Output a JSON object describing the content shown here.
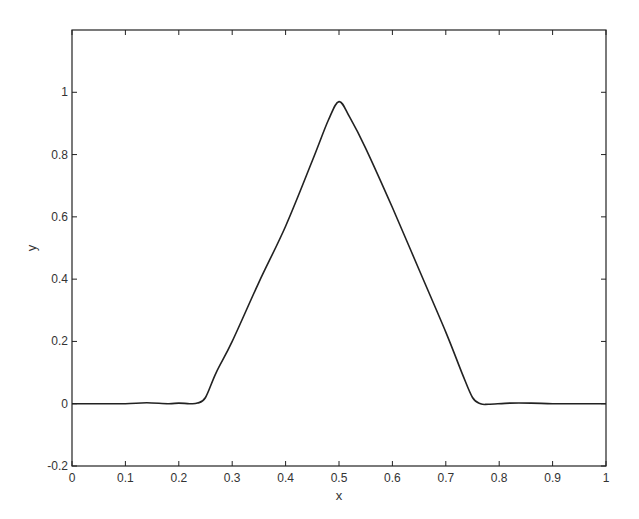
{
  "chart_data": {
    "type": "line",
    "title": "",
    "xlabel": "x",
    "ylabel": "y",
    "xlim": [
      0,
      1
    ],
    "ylim": [
      -0.2,
      1.2
    ],
    "grid": false,
    "legend": null,
    "xticks": [
      0,
      0.1,
      0.2,
      0.3,
      0.4,
      0.5,
      0.6,
      0.7,
      0.8,
      0.9,
      1
    ],
    "xtick_labels": [
      "0",
      "0.1",
      "0.2",
      "0.3",
      "0.4",
      "0.5",
      "0.6",
      "0.7",
      "0.8",
      "0.9",
      "1"
    ],
    "yticks": [
      -0.2,
      0,
      0.2,
      0.4,
      0.6,
      0.8,
      1
    ],
    "ytick_labels": [
      "-0.2",
      "0",
      "0.2",
      "0.4",
      "0.6",
      "0.8",
      "1"
    ],
    "series": [
      {
        "name": "y",
        "color": "#222222",
        "x": [
          0,
          0.05,
          0.1,
          0.14,
          0.18,
          0.2,
          0.22,
          0.235,
          0.25,
          0.27,
          0.3,
          0.35,
          0.4,
          0.45,
          0.48,
          0.5,
          0.52,
          0.55,
          0.6,
          0.65,
          0.7,
          0.73,
          0.75,
          0.765,
          0.78,
          0.82,
          0.86,
          0.9,
          0.95,
          1
        ],
        "y": [
          0,
          0,
          0,
          0.003,
          0,
          0.002,
          0,
          0.002,
          0.02,
          0.1,
          0.2,
          0.39,
          0.57,
          0.78,
          0.91,
          0.97,
          0.92,
          0.82,
          0.63,
          0.43,
          0.23,
          0.1,
          0.02,
          0,
          -0.002,
          0.002,
          0.002,
          0,
          0,
          0
        ]
      }
    ]
  },
  "axes": {
    "xlabel": "x",
    "ylabel": "y"
  }
}
